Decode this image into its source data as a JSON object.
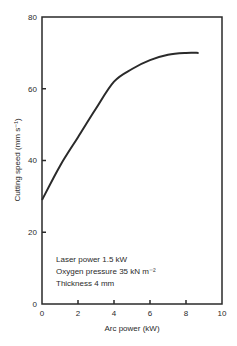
{
  "chart_data": {
    "type": "line",
    "title": "",
    "xlabel": "Arc power (kW)",
    "ylabel": "Cutting speed (mm s⁻¹)",
    "xlim": [
      0,
      10
    ],
    "ylim": [
      0,
      80
    ],
    "x_ticks": [
      "0",
      "2",
      "4",
      "6",
      "8",
      "10"
    ],
    "y_ticks": [
      "0",
      "20",
      "40",
      "60",
      "80"
    ],
    "grid": false,
    "legend": null,
    "series": [
      {
        "name": "Cutting speed",
        "x": [
          0,
          1,
          2,
          3,
          4,
          5,
          6,
          7,
          8,
          8.7
        ],
        "y": [
          29,
          38.5,
          46.5,
          54.5,
          62,
          65.5,
          68,
          69.5,
          70,
          70
        ]
      }
    ],
    "annotations": [
      "Laser power 1.5 kW",
      "Oxygen pressure 35 kN m⁻²",
      "Thickness 4 mm"
    ]
  }
}
